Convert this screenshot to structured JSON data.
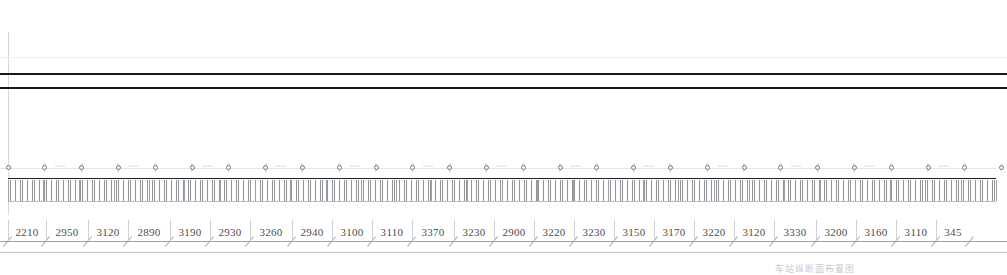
{
  "drawing": {
    "type": "longitudinal-profile",
    "caption": "车站纵断面布置图",
    "sheet_width": 1007,
    "sheet_height": 273,
    "background_color": "#ffffff"
  },
  "colors": {
    "heavy_line": "#191919",
    "faint_line": "#ebedef",
    "dimension_line": "#9ea2a6",
    "dimension_text": "#4a4d50",
    "node_stroke": "#6e7378",
    "hatch_stroke": "#8f9499"
  },
  "profile_lines": [
    {
      "name": "upper-faint-guide",
      "y": 57,
      "weight": "faint"
    },
    {
      "name": "rail-top",
      "y": 73,
      "weight": "heavy"
    },
    {
      "name": "rail-bottom",
      "y": 87,
      "weight": "heavy"
    }
  ],
  "left_guide": {
    "x": 8,
    "y_top": 32,
    "y_bottom": 215
  },
  "node_row": {
    "y": 163,
    "start_x": 8,
    "spacing": 36.8,
    "count": 28,
    "label_text": "====",
    "labels_visible": true
  },
  "hatch_band": {
    "y_top": 178,
    "y_bottom": 201,
    "x_start": 8,
    "x_end": 996,
    "segment_count": 28,
    "description": "dense vertical tick hatching with horizontal rules"
  },
  "dimension_chain": {
    "y_line": 241,
    "y_line_secondary": 252,
    "text_y": 226,
    "x_start": 8,
    "unit": "mm",
    "values": [
      "2210",
      "2950",
      "3120",
      "2890",
      "3190",
      "2930",
      "3260",
      "2940",
      "3100",
      "3110",
      "3370",
      "3230",
      "2900",
      "3220",
      "3230",
      "3150",
      "3170",
      "3220",
      "3120",
      "3330",
      "3200",
      "3160",
      "3110",
      "345"
    ],
    "widths": [
      38,
      42,
      40,
      42,
      40,
      40,
      42,
      40,
      40,
      40,
      42,
      40,
      40,
      40,
      40,
      40,
      40,
      40,
      40,
      42,
      40,
      40,
      40,
      34
    ],
    "last_value_clipped": true
  }
}
